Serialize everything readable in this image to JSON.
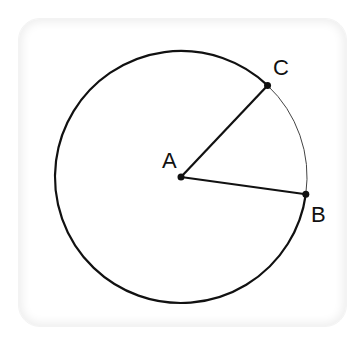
{
  "diagram": {
    "type": "circle-sector",
    "colors": {
      "stroke": "#111111",
      "minor_arc_stroke": "#444444",
      "background": "#ffffff",
      "card_edge": "#eeeeee"
    },
    "circle": {
      "center_label": "A",
      "cx": 181,
      "cy": 177,
      "r": 126
    },
    "points": [
      {
        "id": "A",
        "label": "A",
        "x": 181,
        "y": 177,
        "label_x": 162,
        "label_y": 168
      },
      {
        "id": "B",
        "label": "B",
        "x": 304,
        "y": 194,
        "label_x": 311,
        "label_y": 222
      },
      {
        "id": "C",
        "label": "C",
        "x": 267,
        "y": 86,
        "label_x": 273,
        "label_y": 75
      }
    ],
    "segments": [
      {
        "from": "A",
        "to": "C",
        "name": "radius-AC"
      },
      {
        "from": "A",
        "to": "B",
        "name": "radius-AB"
      }
    ],
    "arcs": [
      {
        "name": "major-arc-BC",
        "from": "B",
        "to": "C",
        "style": "thick"
      },
      {
        "name": "minor-arc-CB",
        "from": "C",
        "to": "B",
        "style": "thin"
      }
    ]
  }
}
